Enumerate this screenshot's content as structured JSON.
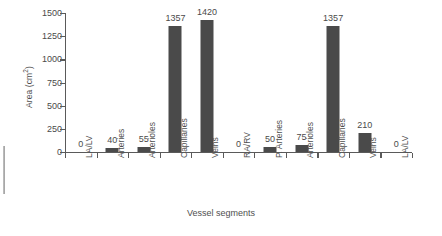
{
  "chart_data": {
    "type": "bar",
    "title": "",
    "xlabel": "Vessel segments",
    "ylabel": "Area (cm²)",
    "ylabel_base": "Area (cm",
    "ylabel_sup": "2",
    "ylabel_tail": ")",
    "ylim": [
      0,
      1500
    ],
    "yticks": [
      0,
      250,
      500,
      750,
      1000,
      1250,
      1500
    ],
    "ytick_labels": [
      "0",
      "250",
      "500",
      "750",
      "1000",
      "1250",
      "1500"
    ],
    "grid": false,
    "legend": "none",
    "bar_color": "#4a4a4a",
    "axis_color": "#5a5a5a",
    "background": "#ffffff",
    "categories": [
      "LA/LV",
      "Arteries",
      "Arterioles",
      "Capillaries",
      "Veins",
      "RA/RV",
      "P. Arteries",
      "Arterioles",
      "Capillaries",
      "Veins",
      "LA/LV"
    ],
    "values": [
      0,
      40,
      55,
      1357,
      1420,
      0,
      50,
      75,
      1357,
      210,
      0
    ],
    "value_labels": [
      "0",
      "40",
      "55",
      "1357",
      "1420",
      "0",
      "50",
      "75",
      "1357",
      "210",
      "0"
    ]
  }
}
